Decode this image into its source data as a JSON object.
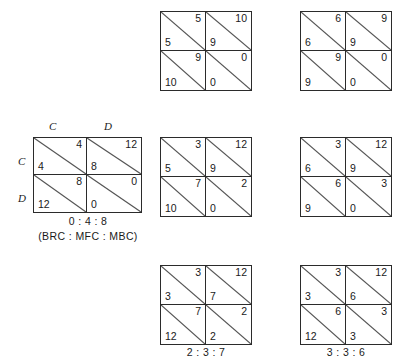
{
  "figure": {
    "title": ""
  },
  "matrices": [
    {
      "id": "matrix-left-labeled",
      "column_labels": [
        "C",
        "D"
      ],
      "row_labels": [
        "C",
        "D"
      ],
      "cells": [
        [
          {
            "top_right": "4",
            "bottom_left": "4"
          },
          {
            "top_right": "12",
            "bottom_left": "8"
          }
        ],
        [
          {
            "top_right": "8",
            "bottom_left": "12"
          },
          {
            "top_right": "0",
            "bottom_left": "0"
          }
        ]
      ],
      "caption_primary": "0 : 4 : 8",
      "caption_secondary": "(BRC : MFC : MBC)"
    },
    {
      "id": "matrix-top-middle",
      "column_labels": [],
      "row_labels": [],
      "cells": [
        [
          {
            "top_right": "5",
            "bottom_left": "5"
          },
          {
            "top_right": "10",
            "bottom_left": "9"
          }
        ],
        [
          {
            "top_right": "9",
            "bottom_left": "10"
          },
          {
            "top_right": "0",
            "bottom_left": "0"
          }
        ]
      ],
      "caption_primary": "",
      "caption_secondary": ""
    },
    {
      "id": "matrix-top-right",
      "column_labels": [],
      "row_labels": [],
      "cells": [
        [
          {
            "top_right": "6",
            "bottom_left": "6"
          },
          {
            "top_right": "9",
            "bottom_left": "9"
          }
        ],
        [
          {
            "top_right": "9",
            "bottom_left": "9"
          },
          {
            "top_right": "0",
            "bottom_left": "0"
          }
        ]
      ],
      "caption_primary": "",
      "caption_secondary": ""
    },
    {
      "id": "matrix-middle-middle",
      "column_labels": [],
      "row_labels": [],
      "cells": [
        [
          {
            "top_right": "3",
            "bottom_left": "5"
          },
          {
            "top_right": "12",
            "bottom_left": "9"
          }
        ],
        [
          {
            "top_right": "7",
            "bottom_left": "10"
          },
          {
            "top_right": "2",
            "bottom_left": "0"
          }
        ]
      ],
      "caption_primary": "",
      "caption_secondary": ""
    },
    {
      "id": "matrix-middle-right",
      "column_labels": [],
      "row_labels": [],
      "cells": [
        [
          {
            "top_right": "3",
            "bottom_left": "6"
          },
          {
            "top_right": "12",
            "bottom_left": "9"
          }
        ],
        [
          {
            "top_right": "6",
            "bottom_left": "9"
          },
          {
            "top_right": "3",
            "bottom_left": "0"
          }
        ]
      ],
      "caption_primary": "",
      "caption_secondary": ""
    },
    {
      "id": "matrix-bottom-middle",
      "column_labels": [],
      "row_labels": [],
      "cells": [
        [
          {
            "top_right": "3",
            "bottom_left": "3"
          },
          {
            "top_right": "12",
            "bottom_left": "7"
          }
        ],
        [
          {
            "top_right": "7",
            "bottom_left": "12"
          },
          {
            "top_right": "2",
            "bottom_left": "2"
          }
        ]
      ],
      "caption_primary": "2 : 3 : 7",
      "caption_secondary": ""
    },
    {
      "id": "matrix-bottom-right",
      "column_labels": [],
      "row_labels": [],
      "cells": [
        [
          {
            "top_right": "3",
            "bottom_left": "3"
          },
          {
            "top_right": "12",
            "bottom_left": "6"
          }
        ],
        [
          {
            "top_right": "6",
            "bottom_left": "12"
          },
          {
            "top_right": "3",
            "bottom_left": "3"
          }
        ]
      ],
      "caption_primary": "3 : 3 : 6",
      "caption_secondary": ""
    }
  ],
  "colors": {
    "line": "#2b2b2b",
    "diagonal": "#555555",
    "text": "#1a1a1a",
    "background": "#ffffff"
  }
}
